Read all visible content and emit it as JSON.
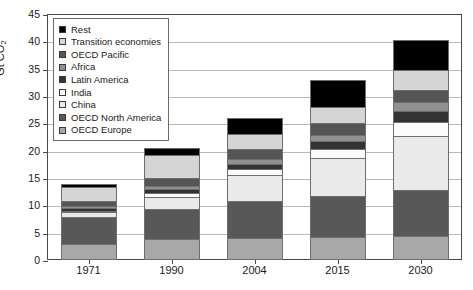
{
  "chart_data": {
    "type": "bar",
    "stacked": true,
    "title": "",
    "subtitle": "",
    "xlabel": "",
    "ylabel": "Gt CO2",
    "ylabel_display": "Gt CO",
    "ylabel_sub": "2",
    "categories": [
      "1971",
      "1990",
      "2004",
      "2015",
      "2030"
    ],
    "ylim": [
      0,
      45
    ],
    "ytick_step": 5,
    "ytick_labels": [
      "0",
      "5",
      "10",
      "15",
      "20",
      "25",
      "30",
      "35",
      "40",
      "45"
    ],
    "grid": true,
    "legend_position": "top-left",
    "series": [
      {
        "name": "OECD Europe",
        "color": "#a8a8a8",
        "values": [
          3.0,
          3.9,
          4.0,
          4.2,
          4.4
        ]
      },
      {
        "name": "OECD North America",
        "color": "#585858",
        "values": [
          4.9,
          5.5,
          6.8,
          7.5,
          8.5
        ]
      },
      {
        "name": "China",
        "color": "#eaeaea",
        "values": [
          0.8,
          2.2,
          4.7,
          7.0,
          9.8
        ]
      },
      {
        "name": "India",
        "color": "#fcfcfc",
        "values": [
          0.2,
          0.6,
          1.1,
          1.6,
          2.5
        ]
      },
      {
        "name": "Latin America",
        "color": "#333333",
        "values": [
          0.6,
          0.8,
          1.0,
          1.4,
          2.0
        ]
      },
      {
        "name": "Africa",
        "color": "#909090",
        "values": [
          0.4,
          0.6,
          0.9,
          1.2,
          1.7
        ]
      },
      {
        "name": "OECD Pacific",
        "color": "#555555",
        "values": [
          1.0,
          1.5,
          1.9,
          2.1,
          2.3
        ]
      },
      {
        "name": "Transition economies",
        "color": "#d5d5d5",
        "values": [
          2.5,
          4.1,
          2.6,
          3.0,
          3.6
        ]
      },
      {
        "name": "Rest",
        "color": "#000000",
        "values": [
          0.6,
          1.3,
          3.0,
          5.0,
          5.5
        ]
      }
    ],
    "totals": [
      14.0,
      20.5,
      26.0,
      33.0,
      40.3
    ],
    "legend_order_top_to_bottom": [
      "Rest",
      "Transition economies",
      "OECD Pacific",
      "Africa",
      "Latin America",
      "India",
      "China",
      "OECD North America",
      "OECD Europe"
    ]
  },
  "colors": {
    "axis": "#4a4a4a",
    "grid": "#b9b9b9",
    "text": "#1a1a1a",
    "background": "#ffffff",
    "bar_outline": "#6e6e6e"
  }
}
